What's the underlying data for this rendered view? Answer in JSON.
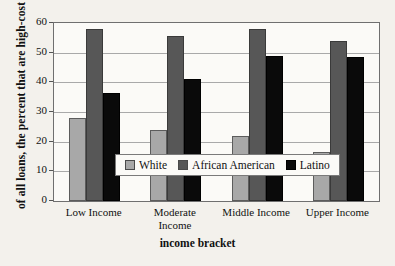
{
  "chart_data": {
    "type": "bar",
    "title": "",
    "xlabel": "income bracket",
    "ylabel": "of all loans, the percent that are high-cost",
    "categories": [
      "Low Income",
      "Moderate Income",
      "Middle Income",
      "Upper Income"
    ],
    "series": [
      {
        "name": "White",
        "color": "#a8a8a8",
        "values": [
          28,
          24,
          22,
          16.5
        ]
      },
      {
        "name": "African American",
        "color": "#575757",
        "values": [
          58,
          55.5,
          58,
          54
        ]
      },
      {
        "name": "Latino",
        "color": "#0a0a0a",
        "values": [
          36.5,
          41,
          49,
          48.5
        ]
      }
    ],
    "ylim": [
      0,
      60
    ],
    "yticks": [
      0,
      10,
      20,
      30,
      40,
      50,
      60
    ],
    "ytick_labels": [
      "0",
      "10",
      "20",
      "30",
      "40",
      "50",
      "60"
    ],
    "grid": true,
    "legend_position": "inside-bottom-center"
  },
  "legend": {
    "entries": [
      {
        "label": "White",
        "swatch": "white"
      },
      {
        "label": "African American",
        "swatch": "aa"
      },
      {
        "label": "Latino",
        "swatch": "lat"
      }
    ]
  },
  "axis": {
    "y_title": "of all loans, the percent that are high-cost",
    "x_title": "income bracket"
  }
}
